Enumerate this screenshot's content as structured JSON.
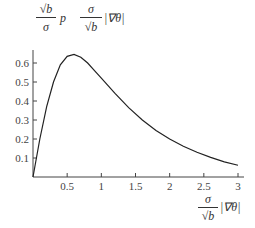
{
  "chart_data": {
    "type": "line",
    "title": "",
    "ylabel": "√b/σ p(σ/√b |∇θ|)",
    "xlabel": "σ/√b |∇θ|",
    "xlim": [
      0,
      3
    ],
    "ylim": [
      0,
      0.66
    ],
    "xticks": [
      "0.5",
      "1",
      "1.5",
      "2",
      "2.5",
      "3"
    ],
    "yticks": [
      "0.1",
      "0.2",
      "0.3",
      "0.4",
      "0.5",
      "0.6"
    ],
    "grid": false,
    "series": [
      {
        "name": "p",
        "x": [
          0,
          0.1,
          0.2,
          0.3,
          0.4,
          0.5,
          0.6,
          0.7,
          0.8,
          0.9,
          1.0,
          1.2,
          1.4,
          1.6,
          1.8,
          2.0,
          2.2,
          2.4,
          2.6,
          2.8,
          3.0
        ],
        "y": [
          0,
          0.2,
          0.37,
          0.5,
          0.59,
          0.635,
          0.645,
          0.63,
          0.6,
          0.56,
          0.52,
          0.44,
          0.365,
          0.3,
          0.245,
          0.2,
          0.162,
          0.13,
          0.103,
          0.08,
          0.062
        ]
      }
    ]
  },
  "labels": {
    "y_num": "√b",
    "y_den": "σ",
    "y_func": "p",
    "x_num": "σ",
    "x_den": "√b",
    "grad": "|∇θ|"
  }
}
